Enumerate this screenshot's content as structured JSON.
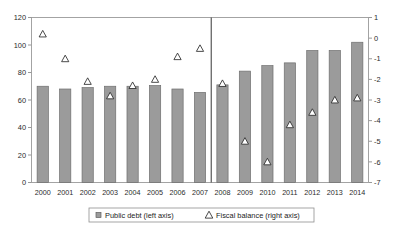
{
  "chart_data": {
    "type": "bar",
    "title": "",
    "xlabel": "",
    "ylabel": "",
    "grid": false,
    "legend_position": "bottom-center",
    "categories": [
      "2000",
      "2001",
      "2002",
      "2003",
      "2004",
      "2005",
      "2006",
      "2007",
      "2008",
      "2009",
      "2010",
      "2011",
      "2012",
      "2013",
      "2014"
    ],
    "left_axis": {
      "label": "",
      "ylim": [
        0,
        120
      ],
      "ticks": [
        0,
        20,
        40,
        60,
        80,
        100,
        120
      ],
      "tick_labels": [
        "0",
        "20",
        "40",
        "60",
        "80",
        "100",
        "120"
      ]
    },
    "right_axis": {
      "label": "",
      "ylim": [
        -7,
        1
      ],
      "ticks": [
        1,
        0,
        -1,
        -2,
        -3,
        -4,
        -5,
        -6,
        -7
      ],
      "tick_labels": [
        "1",
        "0",
        "-1",
        "-2",
        "-3",
        "-4",
        "-5",
        "-6",
        "-7"
      ]
    },
    "series": [
      {
        "name": "Public debt (left axis)",
        "axis": "left",
        "marker": "bar",
        "color": "#9b9b9b",
        "values": [
          70,
          68,
          69,
          70,
          70,
          70.5,
          68,
          65.5,
          71,
          81,
          85,
          87,
          96,
          96,
          102
        ]
      },
      {
        "name": "Fiscal balance (right axis)",
        "axis": "right",
        "marker": "triangle",
        "color": "#ffffff",
        "values": [
          0.2,
          -1.0,
          -2.1,
          -2.8,
          -2.3,
          -2.0,
          -0.9,
          -0.5,
          -2.2,
          -5.0,
          -6.0,
          -4.2,
          -3.6,
          -3.0,
          -2.9
        ]
      }
    ],
    "annotations": [
      {
        "type": "vertical-divider",
        "after_category": "2007",
        "note": "projection separator"
      }
    ]
  },
  "legend": {
    "entries": [
      {
        "label": "Public debt (left axis)",
        "marker": "square"
      },
      {
        "label": "Fiscal balance (right axis)",
        "marker": "triangle"
      }
    ]
  }
}
